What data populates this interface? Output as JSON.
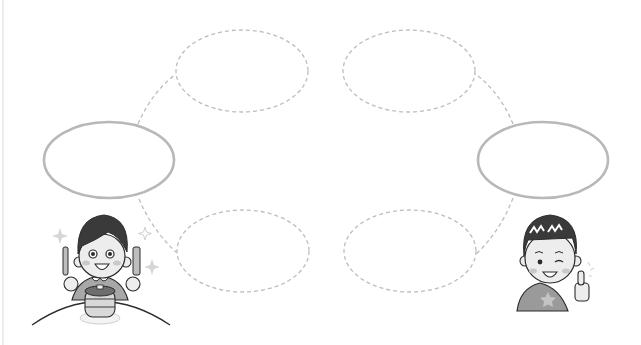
{
  "diagram": {
    "type": "thinking-map-worksheet",
    "background": "#ffffff",
    "colors": {
      "solid_ellipse_stroke": "#b8b8b8",
      "dashed_stroke": "#bdbdbd",
      "ink": "#2b2b2b",
      "hair": "#3a3a3a",
      "skin": "#ededed",
      "shirt": "#9a9a9a",
      "cheek": "#c9c9c9",
      "edge_line": "#ececec"
    },
    "main_nodes": [
      {
        "id": "left-main",
        "cx": 109,
        "cy": 160,
        "rx": 65,
        "ry": 38,
        "style": "solid",
        "text": ""
      },
      {
        "id": "right-main",
        "cx": 543,
        "cy": 160,
        "rx": 65,
        "ry": 38,
        "style": "solid",
        "text": ""
      }
    ],
    "sub_nodes": [
      {
        "id": "top-left",
        "cx": 242,
        "cy": 71,
        "rx": 66,
        "ry": 41,
        "style": "dashed",
        "text": ""
      },
      {
        "id": "top-right",
        "cx": 409,
        "cy": 71,
        "rx": 66,
        "ry": 41,
        "style": "dashed",
        "text": ""
      },
      {
        "id": "bottom-left",
        "cx": 243,
        "cy": 251,
        "rx": 66,
        "ry": 41,
        "style": "dashed",
        "text": ""
      },
      {
        "id": "bottom-right",
        "cx": 410,
        "cy": 251,
        "rx": 66,
        "ry": 41,
        "style": "dashed",
        "text": ""
      }
    ],
    "connectors": [
      {
        "from": "left-main",
        "to": "top-left",
        "path": "M138,124 Q152,92 176,74"
      },
      {
        "from": "left-main",
        "to": "bottom-left",
        "path": "M139,199 Q152,230 177,253"
      },
      {
        "from": "right-main",
        "to": "top-right",
        "path": "M513,124 Q500,92 474,73"
      },
      {
        "from": "right-main",
        "to": "bottom-right",
        "path": "M513,198 Q500,232 475,255"
      }
    ],
    "characters": [
      {
        "id": "boy-eating-pancakes",
        "description": "boy holding knife and fork excited over stack of pancakes",
        "position": "bottom-left"
      },
      {
        "id": "boy-thumbs-up",
        "description": "winking boy giving thumbs up, star on shirt",
        "position": "bottom-right"
      }
    ]
  }
}
